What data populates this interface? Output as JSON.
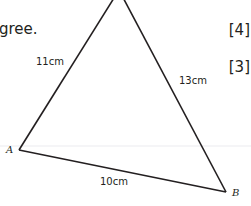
{
  "question": {
    "text_fragment": "gree."
  },
  "marks": [
    {
      "label": "[4]"
    },
    {
      "label": "[3]"
    }
  ],
  "triangle": {
    "vertices": {
      "A": {
        "label": "A",
        "x": 19,
        "y": 150
      },
      "B": {
        "label": "B",
        "x": 226,
        "y": 192
      },
      "C": {
        "label": "",
        "x": 119,
        "y": -10
      }
    },
    "sides": {
      "AC": "11cm",
      "BC": "13cm",
      "AB": "10cm"
    },
    "stroke_color": "#231f20"
  },
  "guide_line_color": "#e9e9ee"
}
